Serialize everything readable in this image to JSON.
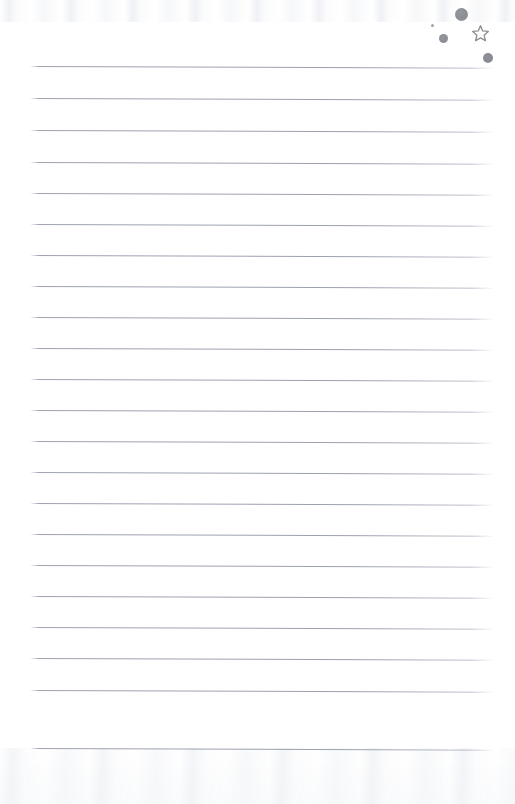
{
  "page": {
    "width": 515,
    "height": 804,
    "background_color": "#ffffff",
    "content_text": "",
    "is_blank": true
  },
  "paper": {
    "ruled_lines": {
      "count": 22,
      "color": "#969ba8",
      "thickness_px": 1,
      "first_line_y": 66,
      "spacing_px": 32,
      "left_margin_x": 30,
      "right_margin_x": 494,
      "slope_deg": 0.22,
      "line_y_positions": [
        66,
        98,
        130,
        162,
        193,
        224,
        255,
        286,
        317,
        348,
        379,
        410,
        441,
        472,
        503,
        534,
        565,
        596,
        627,
        658,
        690,
        748
      ]
    },
    "texture": {
      "top_band_height": 22,
      "bottom_band_height": 56,
      "tint": "#f2f4f7"
    }
  },
  "annotations": {
    "label": "Ink marks",
    "ink_color": "#8b8e94",
    "items": [
      {
        "name": "dot-large",
        "shape": "filled-circle",
        "x": 455,
        "y": 8,
        "size": 13
      },
      {
        "name": "dot-tiny",
        "shape": "filled-circle",
        "x": 431,
        "y": 24,
        "size": 3
      },
      {
        "name": "dot-medium",
        "shape": "filled-circle",
        "x": 439,
        "y": 34,
        "size": 9
      },
      {
        "name": "star",
        "shape": "outline-star-5",
        "x": 472,
        "y": 25,
        "size": 17
      },
      {
        "name": "dot-small",
        "shape": "filled-circle",
        "x": 483,
        "y": 53,
        "size": 10
      }
    ]
  }
}
